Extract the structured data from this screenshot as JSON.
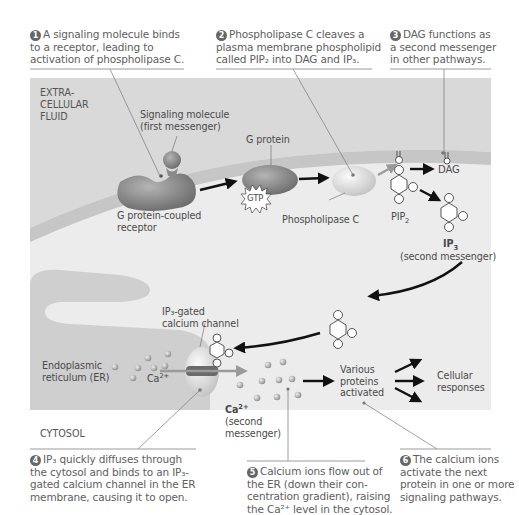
{
  "steps": [
    {
      "num": "1",
      "lines": [
        "A signaling molecule binds",
        "to a receptor, leading to",
        "activation of phospholipase C."
      ]
    },
    {
      "num": "2",
      "lines": [
        "Phospholipase C cleaves a",
        "plasma membrane phospholipid",
        "called PIP₂ into DAG and IP₃."
      ]
    },
    {
      "num": "3",
      "lines": [
        "DAG functions as",
        "a second messenger",
        "in other pathways."
      ]
    },
    {
      "num": "4",
      "lines": [
        "IP₃ quickly diffuses through",
        "the cytosol and binds to an IP₃-",
        "gated calcium channel in the ER",
        "membrane, causing it to open."
      ]
    },
    {
      "num": "5",
      "lines": [
        "Calcium ions flow out of",
        "the ER (down their con-",
        "centration gradient), raising",
        "the Ca²⁺ level in the cytosol."
      ]
    },
    {
      "num": "6",
      "lines": [
        "The calcium ions",
        "activate the next",
        "protein in one or more",
        "signaling pathways."
      ]
    }
  ],
  "regions": {
    "extracellular": [
      "EXTRA-",
      "CELLULAR",
      "FLUID"
    ],
    "cytosol": "CYTOSOL"
  },
  "labels": {
    "signaling_molecule": [
      "Signaling molecule",
      "(first messenger)"
    ],
    "g_protein": "G protein",
    "gtp": "GTP",
    "gpcr": [
      "G protein-coupled",
      "receptor"
    ],
    "phospholipase_c": "Phospholipase C",
    "dag": "DAG",
    "pip2": "PIP",
    "pip2_sub": "2",
    "ip3": "IP",
    "ip3_sub": "3",
    "ip3_desc": "(second messenger)",
    "ip3_gated_channel": [
      "IP₃-gated",
      "calcium channel"
    ],
    "er": [
      "Endoplasmic",
      "reticulum (ER)"
    ],
    "ca_er": "Ca",
    "ca_er_sup": "2+",
    "ca_cytosol": "Ca",
    "ca_cytosol_sup": "2+",
    "ca_desc": [
      "(second",
      "messenger)"
    ],
    "various_proteins": [
      "Various",
      "proteins",
      "activated"
    ],
    "cellular_responses": [
      "Cellular",
      "responses"
    ]
  },
  "colors": {
    "extracellular_bg": "#d9d9d9",
    "membrane": "#c4c4c4",
    "cytosol_bg": "#ececec",
    "er": "#cfcfcf",
    "protein_dark": "#8a8a8a",
    "protein_light": "#d7d7d7",
    "arrow": "#111111",
    "text": "#555555",
    "number_badge": "#666666"
  }
}
